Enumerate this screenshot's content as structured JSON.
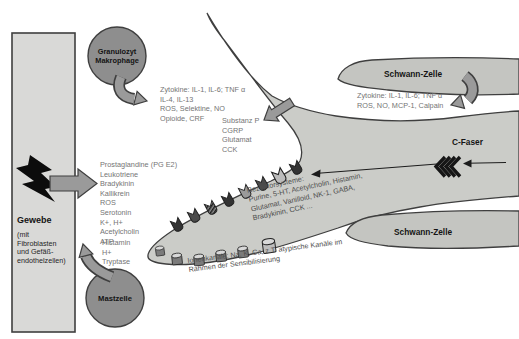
{
  "diagram": {
    "tissue": {
      "title": "Gewebe",
      "subtitle": "(mit\nFibroblasten\nund Gefäß-\nendothelzellen)"
    },
    "granulocyte": {
      "label": "Granulozyt\nMakrophage"
    },
    "mast_cell": {
      "label": "Mastzelle"
    },
    "schwann_top": {
      "label": "Schwann-Zelle"
    },
    "schwann_bottom": {
      "label": "Schwann-Zelle"
    },
    "c_fiber": {
      "label": "C-Faser"
    },
    "releases": {
      "granulocyte": "Zytokine: IL-1, IL-6; TNF α\nIL-4, IL-13\nROS, Selektine, NO\nOpioide, CRF",
      "tissue": "Prostaglandine (PG E2)\nLeukotriene\nBradykinin\nKallikrein\nROS\nSerotonin\nK+, H+\nAcetylcholin\nATP",
      "mast_cell": "Histamin\nH+\nTryptase",
      "terminal": "Substanz P\nCGRP\nGlutamat\nCCK",
      "schwann": "Zytokine: IL-1, IL-6; TNF α\nROS, NO, MCP-1, Calpain"
    },
    "receptor_systems": "Rezeptorsysteme:\nPurine, 5-HT, Acetylcholin, Histamin,\nGlutamat, Vanilloid, NK-1, GABA,\nBradykinin, CCK ...",
    "ion_channels": "Ionenkanäle: Na, K, Ca, z.T. atypische Kanäle im\nRahmen der Sensibilisierung"
  },
  "colors": {
    "body_fill": "#cbccc8",
    "schwann_fill": "#c4c5c1",
    "tissue_fill": "#d9d9d7",
    "cell_fill": "#8e8e8e",
    "arrow_fill": "#9a9a9a",
    "outline": "#3f3f3f",
    "text_gray": "#757575",
    "text_dark": "#141414",
    "receptor_dark": "#333333",
    "receptor_mid": "#9a9a9a",
    "receptor_light": "#bcbcbc"
  }
}
